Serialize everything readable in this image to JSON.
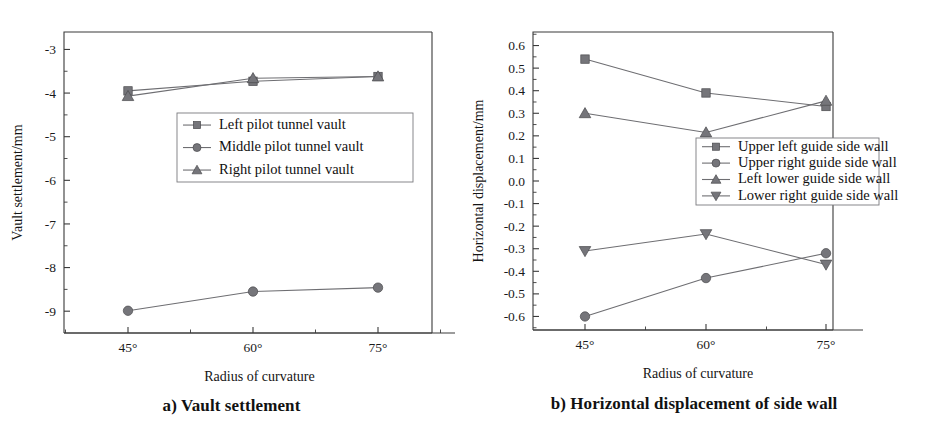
{
  "figure": {
    "panels": [
      {
        "id": "a",
        "caption": "a) Vault settlement",
        "chart_data": {
          "type": "line",
          "title": "",
          "xlabel": "Radius of curvature",
          "ylabel": "Vault settlement/mm",
          "categories": [
            "45°",
            "60°",
            "75°"
          ],
          "ylim": [
            -9.5,
            -2.6
          ],
          "yticks": [
            -3,
            -4,
            -5,
            -6,
            -7,
            -8,
            -9
          ],
          "ytick_labels": [
            "-3",
            "-4",
            "-5",
            "-6",
            "-7",
            "-8",
            "-9"
          ],
          "minor_ticks": true,
          "grid": false,
          "legend_position": "center",
          "series": [
            {
              "name": "Left pilot tunnel vault",
              "marker": "square",
              "values": [
                -3.95,
                -3.73,
                -3.62
              ]
            },
            {
              "name": "Middle pilot tunnel vault",
              "marker": "circle",
              "values": [
                -8.99,
                -8.55,
                -8.46
              ]
            },
            {
              "name": "Right pilot tunnel vault",
              "marker": "triangle-up",
              "values": [
                -4.07,
                -3.66,
                -3.62
              ]
            }
          ]
        }
      },
      {
        "id": "b",
        "caption": "b) Horizontal displacement of side wall",
        "chart_data": {
          "type": "line",
          "title": "",
          "xlabel": "Radius of curvature",
          "ylabel": "Horizontal displacement/mm",
          "categories": [
            "45°",
            "60°",
            "75°"
          ],
          "ylim": [
            -0.66,
            0.66
          ],
          "yticks": [
            0.6,
            0.5,
            0.4,
            0.3,
            0.2,
            0.1,
            0.0,
            -0.1,
            -0.2,
            -0.3,
            -0.4,
            -0.5,
            -0.6
          ],
          "ytick_labels": [
            "0.6",
            "0.5",
            "0.4",
            "0.3",
            "0.2",
            "0.1",
            "0.0",
            "-0.1",
            "-0.2",
            "-0.3",
            "-0.4",
            "-0.5",
            "-0.6"
          ],
          "minor_ticks": true,
          "grid": false,
          "legend_position": "middle-right",
          "series": [
            {
              "name": "Upper left guide side wall",
              "marker": "square",
              "values": [
                0.54,
                0.39,
                0.33
              ]
            },
            {
              "name": "Upper right guide side wall",
              "marker": "circle",
              "values": [
                -0.6,
                -0.43,
                -0.32
              ]
            },
            {
              "name": "Left lower guide side wall",
              "marker": "triangle-up",
              "values": [
                0.3,
                0.215,
                0.355
              ]
            },
            {
              "name": "Lower right guide side wall",
              "marker": "triangle-down",
              "values": [
                -0.31,
                -0.235,
                -0.37
              ]
            }
          ]
        }
      }
    ]
  },
  "colors": {
    "line": "#6e6e72",
    "marker_fill": "#75757a",
    "marker_stroke": "#4a4a4e",
    "axis": "#3a3a3a",
    "text": "#1a1a1a",
    "background": "#ffffff"
  }
}
